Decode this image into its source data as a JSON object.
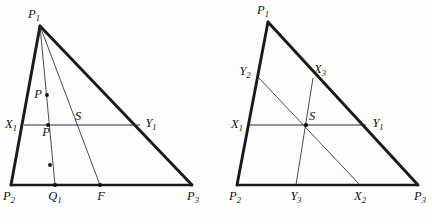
{
  "figure": {
    "background_color": "#fdfdfb",
    "line_color": "#1a1a1a",
    "thin_line_color": "#2a2a2a"
  },
  "left_diagram": {
    "name": "left-triangle-figure",
    "vertices": {
      "P1": {
        "label": "P",
        "sub": "1",
        "x": 40,
        "y": 26
      },
      "P2": {
        "label": "P",
        "sub": "2",
        "x": 11,
        "y": 185
      },
      "P3": {
        "label": "P",
        "sub": "3",
        "x": 192,
        "y": 185
      }
    },
    "points": {
      "X1": {
        "label": "X",
        "sub": "1",
        "x": 24,
        "y": 125
      },
      "Y1": {
        "label": "Y",
        "sub": "1",
        "x": 140,
        "y": 125
      },
      "S": {
        "label": "S",
        "sub": "",
        "x": 77,
        "y": 125
      },
      "Q1": {
        "label": "Q",
        "sub": "1",
        "x": 55,
        "y": 185
      },
      "F": {
        "label": "F",
        "sub": "",
        "x": 100,
        "y": 185
      },
      "P_upper": {
        "label": "P",
        "sub": "",
        "x": 47,
        "y": 95
      },
      "P_lower": {
        "label": "P",
        "sub": "",
        "x": 48,
        "y": 125
      },
      "mid_dot": {
        "label": "",
        "sub": "",
        "x": 50,
        "y": 165
      }
    },
    "labels": {
      "P1": "P₁",
      "P2": "P₂",
      "P3": "P₃",
      "X1": "X₁",
      "Y1": "Y₁",
      "S": "S",
      "Q1": "Q₁",
      "F": "F",
      "P_upper": "P",
      "P_lower": "P"
    }
  },
  "right_diagram": {
    "name": "right-triangle-figure",
    "vertices": {
      "P1": {
        "label": "P",
        "sub": "1",
        "x": 268,
        "y": 22
      },
      "P2": {
        "label": "P",
        "sub": "2",
        "x": 237,
        "y": 185
      },
      "P3": {
        "label": "P",
        "sub": "3",
        "x": 418,
        "y": 185
      }
    },
    "points": {
      "X1": {
        "label": "X",
        "sub": "1",
        "x": 250,
        "y": 125
      },
      "Y1": {
        "label": "Y",
        "sub": "1",
        "x": 366,
        "y": 125
      },
      "Y2": {
        "label": "Y",
        "sub": "2",
        "x": 258,
        "y": 77
      },
      "X3": {
        "label": "X",
        "sub": "3",
        "x": 313,
        "y": 78
      },
      "Y3": {
        "label": "Y",
        "sub": "3",
        "x": 296,
        "y": 185
      },
      "X2": {
        "label": "X",
        "sub": "2",
        "x": 360,
        "y": 185
      },
      "S": {
        "label": "S",
        "sub": "",
        "x": 306,
        "y": 125
      }
    },
    "labels": {
      "P1": "P₁",
      "P2": "P₂",
      "P3": "P₃",
      "X1": "X₁",
      "Y1": "Y₁",
      "X2": "X₂",
      "Y2": "Y₂",
      "X3": "X₃",
      "Y3": "Y₃",
      "S": "S"
    }
  }
}
